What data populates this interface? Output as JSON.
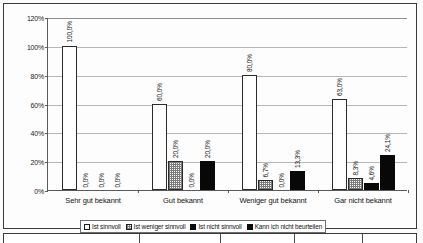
{
  "chart_data": {
    "type": "bar",
    "title": "",
    "subtitle": "",
    "xlabel": "",
    "ylabel": "",
    "ylim": [
      0,
      120
    ],
    "ytick_step": 20,
    "ytick_labels": [
      "0%",
      "20%",
      "40%",
      "60%",
      "80%",
      "100%",
      "120%"
    ],
    "ytick_values": [
      0,
      20,
      40,
      60,
      80,
      100,
      120
    ],
    "grid": true,
    "grid_axis": "y",
    "legend_position": "bottom",
    "categories": [
      "Sehr gut bekannt",
      "Gut bekannt",
      "Weniger gut bekannt",
      "Gar nicht bekannt"
    ],
    "series": [
      {
        "name": "Ist sinnvoll",
        "fill": "white",
        "color": "#ffffff",
        "values": [
          100.0,
          60.0,
          80.0,
          63.0
        ],
        "labels": [
          "100,0%",
          "60,0%",
          "80,0%",
          "63,0%"
        ]
      },
      {
        "name": "Ist weniger sinnvoll",
        "fill": "hatched-gray",
        "color": "#7c7c7c",
        "values": [
          0.0,
          20.0,
          6.7,
          8.3
        ],
        "labels": [
          "0,0%",
          "20,0%",
          "6,7%",
          "8,3%"
        ]
      },
      {
        "name": "Ist nicht sinnvoll",
        "fill": "black",
        "color": "#080808",
        "values": [
          0.0,
          0.0,
          0.0,
          4.6
        ],
        "labels": [
          "0,0%",
          "0,0%",
          "0,0%",
          "4,6%"
        ]
      },
      {
        "name": "Kann ich nicht beurteilen",
        "fill": "black",
        "color": "#080808",
        "values": [
          0.0,
          20.0,
          13.3,
          24.1
        ],
        "labels": [
          "0,0%",
          "20,0%",
          "13,3%",
          "24,1%"
        ]
      }
    ]
  },
  "legend": {
    "items": [
      {
        "label": "Ist sinnvoll"
      },
      {
        "label": "Ist weniger sinnvoll"
      },
      {
        "label": "Ist nicht sinnvoll"
      },
      {
        "label": "Kann ich nicht beurteilen"
      }
    ]
  }
}
